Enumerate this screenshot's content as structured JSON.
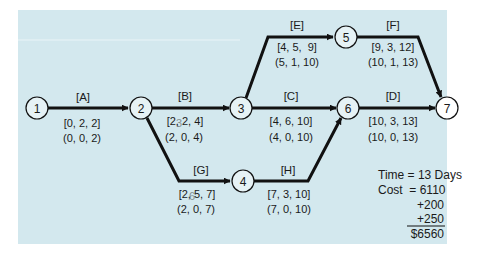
{
  "colors": {
    "panel": "#d3e8ee",
    "line": "#111111",
    "node_fill": "#e6f2f5",
    "text": "#1a1a1a"
  },
  "nodes": [
    {
      "id": "1",
      "label": "1"
    },
    {
      "id": "2",
      "label": "2"
    },
    {
      "id": "3",
      "label": "3"
    },
    {
      "id": "4",
      "label": "4"
    },
    {
      "id": "5",
      "label": "5"
    },
    {
      "id": "6",
      "label": "6"
    },
    {
      "id": "7",
      "label": "7"
    }
  ],
  "activities": {
    "A": {
      "name": "[A]",
      "from": "1",
      "to": "2",
      "est": "[0, 2, 2]",
      "lst": "(0, 0, 2)"
    },
    "B": {
      "name": "[B]",
      "from": "2",
      "to": "3",
      "est": "[2, 2, 4]",
      "est_struck": "3",
      "lst": "(2, 0, 4)"
    },
    "C": {
      "name": "[C]",
      "from": "3",
      "to": "6",
      "est": "[4, 6, 10]",
      "lst": "(4, 0, 10)"
    },
    "D": {
      "name": "[D]",
      "from": "6",
      "to": "7",
      "est": "[10, 3, 13]",
      "lst": "(10, 0, 13)"
    },
    "E": {
      "name": "[E]",
      "from": "3",
      "to": "5",
      "est": "[4, 5,  9]",
      "lst": "(5, 1, 10)"
    },
    "F": {
      "name": "[F]",
      "from": "5",
      "to": "7",
      "est": "[9, 3, 12]",
      "lst": "(10, 1, 13)"
    },
    "G": {
      "name": "[G]",
      "from": "2",
      "to": "4",
      "est": "[2, 5, 7]",
      "est_struck": "6",
      "lst": "(2, 0, 7)"
    },
    "H": {
      "name": "[H]",
      "from": "4",
      "to": "6",
      "est": "[7, 3, 10]",
      "lst": "(7, 0, 10)"
    }
  },
  "summary": {
    "time_line": "Time = 13 Days",
    "cost_line": "Cost  = 6110",
    "add1": "+200",
    "add2": "+250",
    "total": "$6560"
  }
}
